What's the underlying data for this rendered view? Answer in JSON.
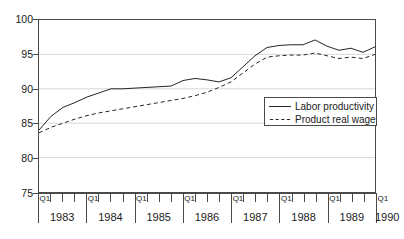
{
  "chart_data": {
    "type": "line",
    "title": "",
    "xlabel": "",
    "ylabel": "",
    "ylim": [
      75,
      100
    ],
    "yticks": [
      75,
      80,
      85,
      90,
      95,
      100
    ],
    "grid": true,
    "legend_position": "center-right",
    "x_axis": {
      "tick_label_prefix": "Q1",
      "years": [
        "1983",
        "1984",
        "1985",
        "1986",
        "1987",
        "1988",
        "1989",
        "1990"
      ],
      "quarters_per_year": 4,
      "first_period": "Q1 1983",
      "last_period": "Q1 1990"
    },
    "x": [
      "Q1 1983",
      "Q2 1983",
      "Q3 1983",
      "Q4 1983",
      "Q1 1984",
      "Q2 1984",
      "Q3 1984",
      "Q4 1984",
      "Q1 1985",
      "Q2 1985",
      "Q3 1985",
      "Q4 1985",
      "Q1 1986",
      "Q2 1986",
      "Q3 1986",
      "Q4 1986",
      "Q1 1987",
      "Q2 1987",
      "Q3 1987",
      "Q4 1987",
      "Q1 1988",
      "Q2 1988",
      "Q3 1988",
      "Q4 1988",
      "Q1 1989",
      "Q2 1989",
      "Q3 1989",
      "Q4 1989",
      "Q1 1990"
    ],
    "series": [
      {
        "name": "Labor productivity",
        "style": "solid",
        "color": "#262626",
        "values": [
          84.0,
          86.0,
          87.3,
          88.0,
          88.8,
          89.4,
          90.0,
          90.0,
          90.1,
          90.2,
          90.3,
          90.4,
          91.2,
          91.5,
          91.3,
          91.0,
          91.6,
          93.2,
          94.8,
          96.0,
          96.3,
          96.4,
          96.4,
          97.1,
          96.2,
          95.6,
          95.9,
          95.3,
          96.1
        ]
      },
      {
        "name": "Product real wage",
        "style": "dashed",
        "color": "#262626",
        "values": [
          83.6,
          84.4,
          85.0,
          85.6,
          86.1,
          86.5,
          86.8,
          87.1,
          87.4,
          87.7,
          88.0,
          88.3,
          88.6,
          89.0,
          89.5,
          90.2,
          91.0,
          92.3,
          93.6,
          94.6,
          94.8,
          94.9,
          94.9,
          95.2,
          94.8,
          94.4,
          94.6,
          94.4,
          95.0
        ]
      }
    ]
  },
  "legend": {
    "items": [
      {
        "label": "Labor productivity",
        "style": "solid"
      },
      {
        "label": "Product real wage",
        "style": "dashed"
      }
    ]
  },
  "y_axis_labels": [
    "100",
    "95",
    "90",
    "85",
    "80",
    "75"
  ]
}
